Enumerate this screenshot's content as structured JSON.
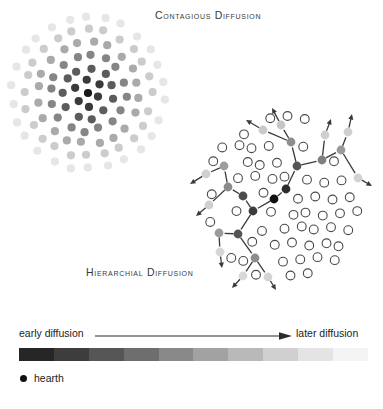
{
  "figure": {
    "panels": {
      "contagious": {
        "title": "Contagious Diffusion",
        "center": [
          88,
          93
        ],
        "radius": 76,
        "dot_radius": 4.1,
        "rings": [
          {
            "ring": 0,
            "count": 1,
            "shade": "#1a1a1a"
          },
          {
            "ring": 1,
            "count": 6,
            "shade": "#3a3a3a"
          },
          {
            "ring": 2,
            "count": 11,
            "shade": "#5c5c5c"
          },
          {
            "ring": 3,
            "count": 16,
            "shade": "#858585"
          },
          {
            "ring": 4,
            "count": 20,
            "shade": "#aaaaaa"
          },
          {
            "ring": 5,
            "count": 24,
            "shade": "#cccccc"
          },
          {
            "ring": 6,
            "count": 26,
            "shade": "#e6e6e6"
          }
        ]
      },
      "hierarchial": {
        "title": "Hierarchial Diffusion",
        "center": [
          283,
          198
        ],
        "radius": 84,
        "dot_radius": 4.4,
        "unaffected_stroke": "#4a4a4a",
        "hearth": {
          "x": 274,
          "y": 199,
          "shade": "#111111"
        },
        "network_nodes": [
          {
            "x": 274,
            "y": 199,
            "shade": "#111111"
          },
          {
            "x": 286,
            "y": 189,
            "shade": "#2d2d2d"
          },
          {
            "x": 297,
            "y": 166,
            "shade": "#555555"
          },
          {
            "x": 291,
            "y": 142,
            "shade": "#8e8e8e"
          },
          {
            "x": 281,
            "y": 125,
            "shade": "#c6c6c6"
          },
          {
            "x": 263,
            "y": 130,
            "shade": "#c9c9c9"
          },
          {
            "x": 322,
            "y": 160,
            "shade": "#7f7f7f"
          },
          {
            "x": 341,
            "y": 150,
            "shade": "#9a9a9a"
          },
          {
            "x": 348,
            "y": 132,
            "shade": "#cfcfcf"
          },
          {
            "x": 358,
            "y": 178,
            "shade": "#d2d2d2"
          },
          {
            "x": 325,
            "y": 135,
            "shade": "#cfcfcf"
          },
          {
            "x": 253,
            "y": 211,
            "shade": "#3c3c3c"
          },
          {
            "x": 243,
            "y": 196,
            "shade": "#4d4d4d"
          },
          {
            "x": 228,
            "y": 187,
            "shade": "#8b8b8b"
          },
          {
            "x": 224,
            "y": 166,
            "shade": "#9d9d9d"
          },
          {
            "x": 206,
            "y": 174,
            "shade": "#d0d0d0"
          },
          {
            "x": 238,
            "y": 234,
            "shade": "#555555"
          },
          {
            "x": 219,
            "y": 233,
            "shade": "#9b9b9b"
          },
          {
            "x": 220,
            "y": 252,
            "shade": "#d6d6d6"
          },
          {
            "x": 255,
            "y": 258,
            "shade": "#8d8d8d"
          },
          {
            "x": 243,
            "y": 276,
            "shade": "#d8d8d8"
          },
          {
            "x": 268,
            "y": 277,
            "shade": "#d4d4d4"
          },
          {
            "x": 209,
            "y": 205,
            "shade": "#cfcfcf"
          }
        ]
      }
    },
    "legend": {
      "early_label": "early diffusion",
      "later_label": "later diffusion",
      "hearth_label": "hearth",
      "hearth_color": "#111111",
      "gradient_steps": [
        "#262626",
        "#3d3d3d",
        "#565656",
        "#6e6e6e",
        "#898989",
        "#a2a2a2",
        "#b9b9b9",
        "#d0d0d0",
        "#e4e4e4",
        "#f4f4f4"
      ],
      "arrow_color": "#2b2b2b"
    }
  }
}
